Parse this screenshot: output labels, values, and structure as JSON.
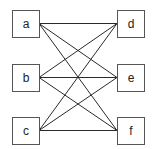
{
  "diagram": {
    "type": "bipartite-graph",
    "title": "",
    "colors": {
      "line": "#2a2a2a",
      "box_stroke": "#555555",
      "box_fill": "#ffffff",
      "text": "#222222"
    },
    "nodes": [
      {
        "id": "a",
        "label": "a",
        "x": 12,
        "y": 10,
        "w": 27,
        "h": 27
      },
      {
        "id": "b",
        "label": "b",
        "x": 12,
        "y": 64,
        "w": 27,
        "h": 27
      },
      {
        "id": "c",
        "label": "c",
        "x": 12,
        "y": 117,
        "w": 27,
        "h": 27
      },
      {
        "id": "d",
        "label": "d",
        "x": 117,
        "y": 10,
        "w": 27,
        "h": 27
      },
      {
        "id": "e",
        "label": "e",
        "x": 117,
        "y": 64,
        "w": 27,
        "h": 27
      },
      {
        "id": "f",
        "label": "f",
        "x": 117,
        "y": 117,
        "w": 27,
        "h": 27
      }
    ],
    "edges": [
      [
        "a",
        "d"
      ],
      [
        "a",
        "e"
      ],
      [
        "a",
        "f"
      ],
      [
        "b",
        "d"
      ],
      [
        "b",
        "e"
      ],
      [
        "b",
        "f"
      ],
      [
        "c",
        "d"
      ],
      [
        "c",
        "e"
      ],
      [
        "c",
        "f"
      ]
    ]
  }
}
